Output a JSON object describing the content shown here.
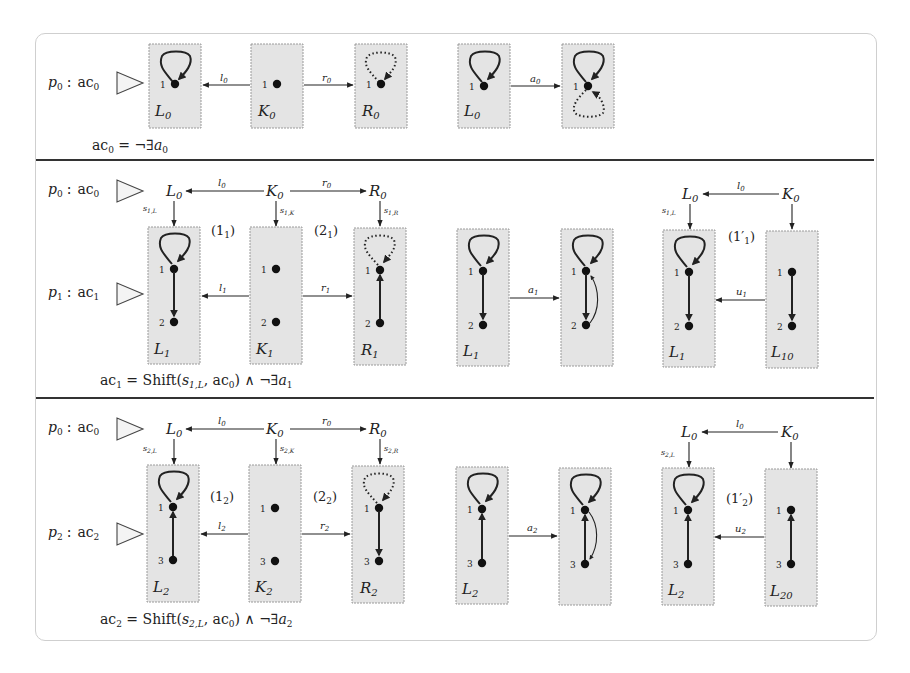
{
  "figure": {
    "rows": [
      {
        "id": "row0",
        "rule_label": {
          "p": "p",
          "p_sub": "0",
          "sep": ":",
          "ac": "ac",
          "ac_sub": "0"
        },
        "graphs": {
          "L": {
            "name": "L",
            "sub": "0"
          },
          "K": {
            "name": "K",
            "sub": "0"
          },
          "R": {
            "name": "R",
            "sub": "0"
          }
        },
        "morphisms": {
          "l": {
            "name": "l",
            "sub": "0"
          },
          "r": {
            "name": "r",
            "sub": "0"
          },
          "a": {
            "name": "a",
            "sub": "0"
          }
        },
        "condition": {
          "lhs": "ac",
          "lhs_sub": "0",
          "rhs": " = ¬∃",
          "rhs_var": "a",
          "rhs_sub": "0"
        },
        "node_labels": [
          "1"
        ]
      },
      {
        "id": "row1",
        "rule_top": {
          "p": "p",
          "p_sub": "0",
          "ac": "ac",
          "ac_sub": "0",
          "L": "L",
          "K": "K",
          "R": "R",
          "sub": "0",
          "l": "l",
          "r": "r"
        },
        "rule_label": {
          "p": "p",
          "p_sub": "1",
          "sep": ":",
          "ac": "ac",
          "ac_sub": "1"
        },
        "graphs": {
          "L": {
            "name": "L",
            "sub": "1"
          },
          "K": {
            "name": "K",
            "sub": "1"
          },
          "R": {
            "name": "R",
            "sub": "1"
          },
          "Lx": {
            "name": "L",
            "sub": "10"
          }
        },
        "morphisms": {
          "l": {
            "name": "l",
            "sub": "1"
          },
          "r": {
            "name": "r",
            "sub": "1"
          },
          "a": {
            "name": "a",
            "sub": "1"
          },
          "u": {
            "name": "u",
            "sub": "1"
          },
          "sL": {
            "name": "s",
            "sub": "1,L"
          },
          "sK": {
            "name": "s",
            "sub": "1,K"
          },
          "sR": {
            "name": "s",
            "sub": "1,R"
          }
        },
        "squares": {
          "one": "(1",
          "one_sub": "1",
          "two": "(2",
          "two_sub": "1",
          "one_prime": "(1′",
          "close": ")"
        },
        "condition": {
          "lhs": "ac",
          "lhs_sub": "1",
          "eq": " = Shift(",
          "s": "s",
          "s_sub": "1,L",
          "mid": ", ac",
          "mid_sub": "0",
          "tail": ") ∧ ¬∃",
          "var": "a",
          "var_sub": "1"
        },
        "node_labels": [
          "1",
          "2"
        ]
      },
      {
        "id": "row2",
        "rule_top": {
          "p": "p",
          "p_sub": "0",
          "ac": "ac",
          "ac_sub": "0",
          "L": "L",
          "K": "K",
          "R": "R",
          "sub": "0",
          "l": "l",
          "r": "r"
        },
        "rule_label": {
          "p": "p",
          "p_sub": "2",
          "sep": ":",
          "ac": "ac",
          "ac_sub": "2"
        },
        "graphs": {
          "L": {
            "name": "L",
            "sub": "2"
          },
          "K": {
            "name": "K",
            "sub": "2"
          },
          "R": {
            "name": "R",
            "sub": "2"
          },
          "Lx": {
            "name": "L",
            "sub": "20"
          }
        },
        "morphisms": {
          "l": {
            "name": "l",
            "sub": "2"
          },
          "r": {
            "name": "r",
            "sub": "2"
          },
          "a": {
            "name": "a",
            "sub": "2"
          },
          "u": {
            "name": "u",
            "sub": "2"
          },
          "sL": {
            "name": "s",
            "sub": "2,L"
          },
          "sK": {
            "name": "s",
            "sub": "2,K"
          },
          "sR": {
            "name": "s",
            "sub": "2,R"
          }
        },
        "squares": {
          "one": "(1",
          "one_sub": "2",
          "two": "(2",
          "two_sub": "2",
          "one_prime": "(1′",
          "close": ")"
        },
        "condition": {
          "lhs": "ac",
          "lhs_sub": "2",
          "eq": " = Shift(",
          "s": "s",
          "s_sub": "2,L",
          "mid": ", ac",
          "mid_sub": "0",
          "tail": ") ∧ ¬∃",
          "var": "a",
          "var_sub": "2"
        },
        "node_labels": [
          "1",
          "3"
        ]
      }
    ]
  }
}
